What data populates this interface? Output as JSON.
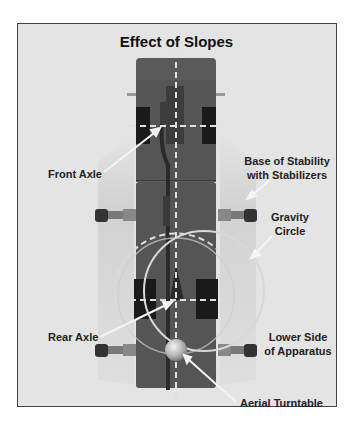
{
  "title": "Effect of Slopes",
  "labels": {
    "front_axle": "Front Axle",
    "base_line1": "Base of Stability",
    "base_line2": "with Stabilizers",
    "gravity_line1": "Gravity",
    "gravity_line2": "Circle",
    "rear_axle": "Rear Axle",
    "lower_line1": "Lower Side",
    "lower_line2": "of Apparatus",
    "turntable": "Aerial Turntable"
  },
  "colors": {
    "background": "#e4e4e4",
    "truck_body": "#555555",
    "wheels": "#1a1a1a",
    "stabilizer_pad": "#333333",
    "stabilizer_arm": "#7a7a7a",
    "centerline": "#dddddd",
    "circle": "#d0d0d0"
  }
}
